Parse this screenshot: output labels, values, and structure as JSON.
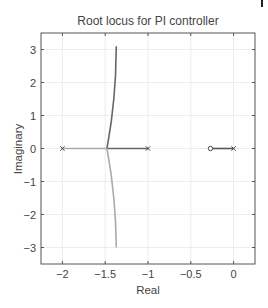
{
  "chart_data": {
    "type": "line",
    "title": "Root locus for PI controller",
    "xlabel": "Real",
    "ylabel": "Imaginary",
    "xlim": [
      -2.25,
      0.25
    ],
    "ylim": [
      -3.5,
      3.5
    ],
    "xticks": [
      -2,
      -1.5,
      -1,
      -0.5,
      0
    ],
    "xtick_labels": [
      "−2",
      "−1.5",
      "−1",
      "−0.5",
      "0"
    ],
    "yticks": [
      3,
      2,
      1,
      0,
      -1,
      -2,
      -3
    ],
    "ytick_labels": [
      "3",
      "2",
      "1",
      "0",
      "−1",
      "−2",
      "−3"
    ],
    "grid": true,
    "legend": null,
    "poles": [
      [
        -2,
        0
      ],
      [
        -1,
        0
      ],
      [
        0,
        0
      ]
    ],
    "zeros": [
      [
        -0.27,
        0
      ]
    ],
    "series": [
      {
        "name": "branch-1",
        "color": "#666666",
        "points": [
          [
            -1,
            0
          ],
          [
            -1.48,
            0
          ],
          [
            -1.46,
            0.3
          ],
          [
            -1.43,
            0.8
          ],
          [
            -1.4,
            1.5
          ],
          [
            -1.38,
            2.2
          ],
          [
            -1.37,
            3.1
          ]
        ]
      },
      {
        "name": "branch-2",
        "color": "#aaaaaa",
        "points": [
          [
            -2,
            0
          ],
          [
            -1.48,
            0
          ],
          [
            -1.46,
            -0.3
          ],
          [
            -1.43,
            -0.8
          ],
          [
            -1.4,
            -1.5
          ],
          [
            -1.38,
            -2.2
          ],
          [
            -1.37,
            -3.0
          ]
        ]
      },
      {
        "name": "branch-3",
        "color": "#555555",
        "points": [
          [
            0,
            0
          ],
          [
            -0.27,
            0
          ]
        ]
      }
    ]
  }
}
